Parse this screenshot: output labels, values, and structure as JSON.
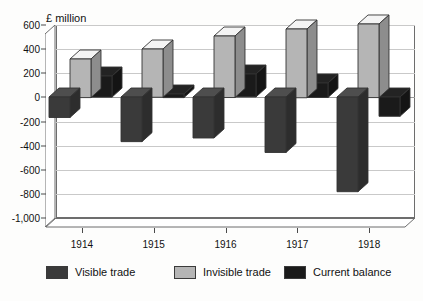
{
  "chart_data": {
    "type": "bar",
    "title": "",
    "ylabel": "£ million",
    "xlabel": "",
    "categories": [
      "1914",
      "1915",
      "1916",
      "1917",
      "1918"
    ],
    "series": [
      {
        "name": "Visible trade",
        "color": "#3a3a3a",
        "values": [
          -170,
          -370,
          -340,
          -460,
          -785
        ]
      },
      {
        "name": "Invisible trade",
        "color": "#b5b5b5",
        "values": [
          320,
          400,
          510,
          570,
          610
        ]
      },
      {
        "name": "Current balance",
        "color": "#1a1a1a",
        "values": [
          175,
          30,
          190,
          120,
          -160
        ]
      }
    ],
    "ylim": [
      -1000,
      600
    ],
    "yticks": [
      600,
      400,
      200,
      0,
      -200,
      -400,
      -600,
      -800,
      -1000
    ],
    "ytick_labels": [
      "600",
      "400",
      "200",
      "0",
      "-200",
      "-400",
      "-600",
      "-800",
      "-1,000"
    ],
    "grid": true,
    "legend_position": "bottom",
    "style": "3d-column"
  },
  "legend": {
    "items": [
      {
        "label": "Visible trade",
        "color": "#3a3a3a"
      },
      {
        "label": "Invisible trade",
        "color": "#b5b5b5"
      },
      {
        "label": "Current balance",
        "color": "#1a1a1a"
      }
    ]
  },
  "colors": {
    "visible_trade": "#3a3a3a",
    "invisible_trade": "#b5b5b5",
    "current_balance": "#1a1a1a",
    "grid": "#c9c9c9",
    "axis": "#4a4a4a",
    "frame": "#6d6d6d",
    "background": "#fdfdfc"
  }
}
